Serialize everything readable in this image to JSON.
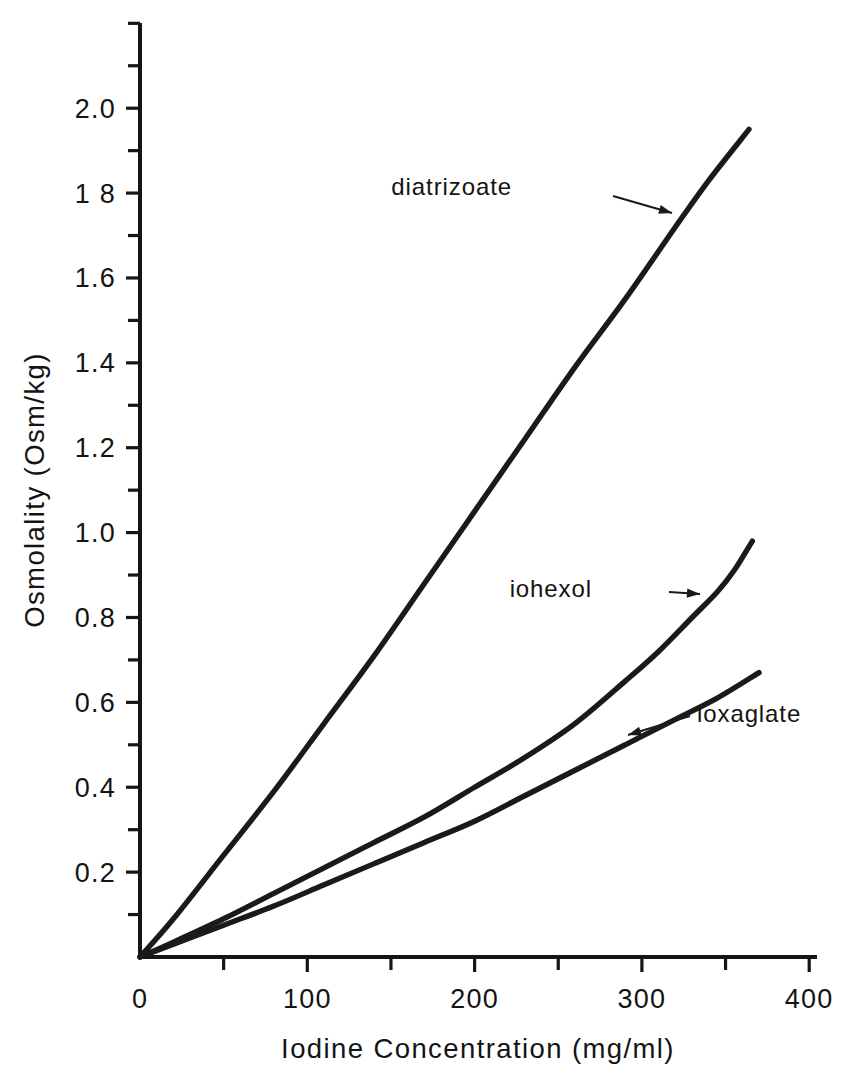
{
  "chart_data": {
    "type": "line",
    "title": "",
    "xlabel": "Iodine Concentration (mg/ml)",
    "ylabel": "Osmolality (Osm/kg)",
    "xlim": [
      0,
      420
    ],
    "ylim": [
      0,
      2.2
    ],
    "xticks": [
      0,
      100,
      200,
      300,
      400
    ],
    "xtick_labels": [
      "0",
      "100",
      "200",
      "300",
      "400"
    ],
    "xtick_minor_step": 50,
    "yticks": [
      0.2,
      0.4,
      0.6,
      0.8,
      1.0,
      1.2,
      1.4,
      1.6,
      1.8,
      2.0
    ],
    "ytick_labels": [
      "0.2",
      "0.4",
      "0.6",
      "0.8",
      "1.0",
      "1.2",
      "1.4",
      "1.6",
      "1 8",
      "2.0"
    ],
    "ytick_minor_step": 0.1,
    "grid": false,
    "legend_position": "inline-annotations",
    "series": [
      {
        "name": "diatrizoate",
        "color": "#1a1a1a",
        "x": [
          0,
          20,
          50,
          80,
          110,
          140,
          170,
          200,
          230,
          260,
          290,
          320,
          340,
          364
        ],
        "values": [
          0.0,
          0.09,
          0.24,
          0.39,
          0.55,
          0.71,
          0.88,
          1.05,
          1.22,
          1.39,
          1.55,
          1.72,
          1.83,
          1.95
        ]
      },
      {
        "name": "iohexol",
        "color": "#1a1a1a",
        "x": [
          0,
          20,
          50,
          80,
          110,
          140,
          170,
          200,
          230,
          260,
          290,
          310,
          330,
          345,
          355,
          366
        ],
        "values": [
          0.0,
          0.035,
          0.09,
          0.15,
          0.21,
          0.27,
          0.33,
          0.4,
          0.47,
          0.55,
          0.65,
          0.72,
          0.8,
          0.86,
          0.91,
          0.98
        ]
      },
      {
        "name": "ioxaglate",
        "color": "#1a1a1a",
        "x": [
          0,
          20,
          50,
          80,
          110,
          140,
          170,
          200,
          230,
          260,
          290,
          320,
          345,
          370
        ],
        "values": [
          0.0,
          0.03,
          0.075,
          0.12,
          0.17,
          0.22,
          0.27,
          0.32,
          0.38,
          0.44,
          0.5,
          0.56,
          0.61,
          0.67
        ]
      }
    ],
    "annotations": [
      {
        "text": "diatrizoate",
        "label_x": 512,
        "label_y": 195,
        "arrow_from": [
          613,
          196
        ],
        "arrow_to": [
          672,
          213
        ],
        "direction": "right"
      },
      {
        "text": "iohexol",
        "label_x": 592,
        "label_y": 597,
        "arrow_from": [
          669,
          592
        ],
        "arrow_to": [
          700,
          594
        ],
        "direction": "right"
      },
      {
        "text": "ioxaglate",
        "label_x": 697,
        "label_y": 722,
        "arrow_from": [
          690,
          716
        ],
        "arrow_to": [
          628,
          735
        ],
        "direction": "left"
      }
    ]
  },
  "axes": {
    "y_title": "Osmolality (Osm/kg)",
    "x_title": "Iodine Concentration (mg/ml)",
    "origin_label": "0"
  }
}
